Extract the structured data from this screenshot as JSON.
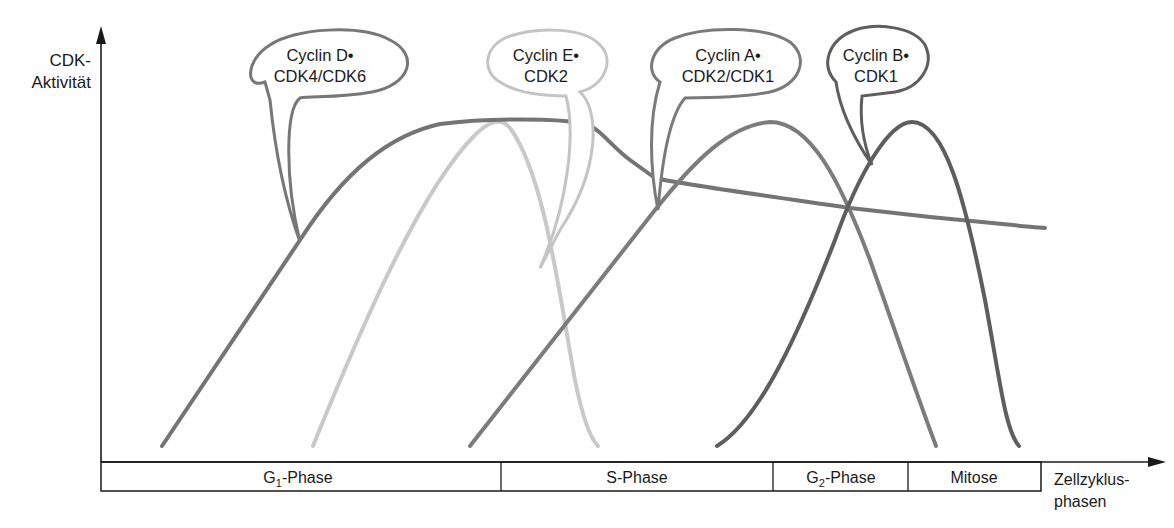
{
  "y_axis": {
    "label_line1": "CDK-",
    "label_line2": "Aktivität"
  },
  "x_axis": {
    "label_line1": "Zellzyklus-",
    "label_line2": "phasen"
  },
  "phases": [
    {
      "name": "G",
      "sub": "1",
      "suffix": "-Phase"
    },
    {
      "name": "S-Phase",
      "sub": "",
      "suffix": ""
    },
    {
      "name": "G",
      "sub": "2",
      "suffix": "-Phase"
    },
    {
      "name": "Mitose",
      "sub": "",
      "suffix": ""
    }
  ],
  "complexes": [
    {
      "id": "cyclin-d",
      "line1": "Cyclin D•",
      "line2": "CDK4/CDK6",
      "color": "#6e6e6e"
    },
    {
      "id": "cyclin-e",
      "line1": "Cyclin E•",
      "line2": "CDK2",
      "color": "#c4c4c4"
    },
    {
      "id": "cyclin-a",
      "line1": "Cyclin A•",
      "line2": "CDK2/CDK1",
      "color": "#7a7a7a"
    },
    {
      "id": "cyclin-b",
      "line1": "Cyclin B•",
      "line2": "CDK1",
      "color": "#5e5e5e"
    }
  ],
  "colors": {
    "axis": "#1a1a1a",
    "background": "#ffffff"
  }
}
